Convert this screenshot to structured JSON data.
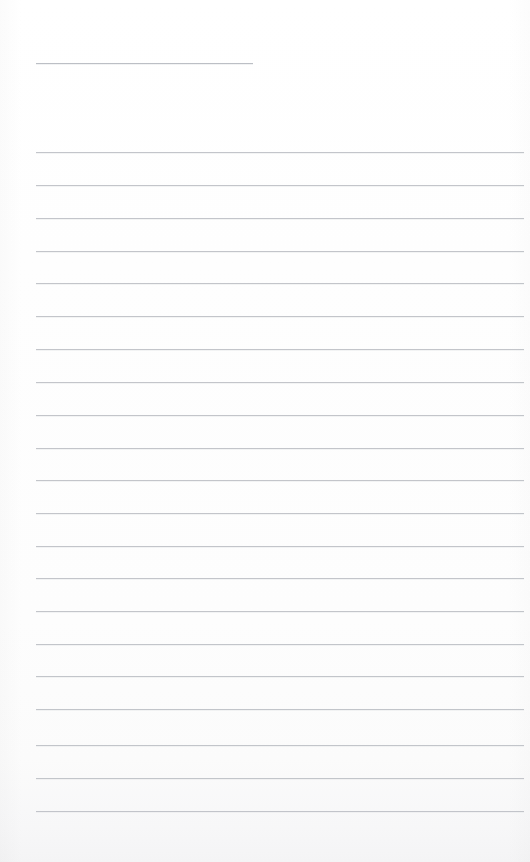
{
  "page": {
    "kind": "blank-lined-notebook-page",
    "width": 530,
    "height": 862,
    "background_color": "#fefefe",
    "rule_color": "#b9bcc2",
    "text_content": "",
    "visible_text": []
  },
  "rules": {
    "short_rule": {
      "name": "title-rule",
      "x": 36,
      "y": 63,
      "width": 217
    },
    "full_rules": [
      {
        "x": 36,
        "y": 152,
        "width": 488
      },
      {
        "x": 36,
        "y": 185,
        "width": 488
      },
      {
        "x": 36,
        "y": 218,
        "width": 488
      },
      {
        "x": 36,
        "y": 251,
        "width": 488
      },
      {
        "x": 36,
        "y": 283,
        "width": 488
      },
      {
        "x": 36,
        "y": 316,
        "width": 488
      },
      {
        "x": 36,
        "y": 349,
        "width": 488
      },
      {
        "x": 36,
        "y": 382,
        "width": 488
      },
      {
        "x": 36,
        "y": 415,
        "width": 488
      },
      {
        "x": 36,
        "y": 448,
        "width": 488
      },
      {
        "x": 36,
        "y": 480,
        "width": 488
      },
      {
        "x": 36,
        "y": 513,
        "width": 488
      },
      {
        "x": 36,
        "y": 546,
        "width": 488
      },
      {
        "x": 36,
        "y": 578,
        "width": 488
      },
      {
        "x": 36,
        "y": 611,
        "width": 488
      },
      {
        "x": 36,
        "y": 644,
        "width": 488
      },
      {
        "x": 36,
        "y": 676,
        "width": 488
      },
      {
        "x": 36,
        "y": 709,
        "width": 488
      },
      {
        "x": 36,
        "y": 745,
        "width": 488
      },
      {
        "x": 36,
        "y": 778,
        "width": 488
      },
      {
        "x": 36,
        "y": 811,
        "width": 488
      }
    ]
  }
}
